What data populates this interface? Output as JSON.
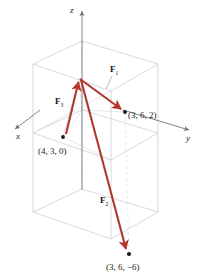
{
  "figure": {
    "background_color": "#ffffff",
    "vector_color": "#b4362b",
    "box_color": "#c9c9c9",
    "axis_color": "#6e6e6e",
    "point_color": "#1a1a1a"
  },
  "axes": [
    {
      "name": "x-axis",
      "label": "x",
      "label_x": 16,
      "label_y": 139,
      "arrow_from_x": 40,
      "arrow_from_y": 110,
      "arrow_to_x": 13,
      "arrow_to_y": 130
    },
    {
      "name": "y-axis",
      "label": "y",
      "label_x": 186,
      "label_y": 141,
      "arrow_from_x": 123,
      "arrow_from_y": 110,
      "arrow_to_x": 191,
      "arrow_to_y": 131
    },
    {
      "name": "z-axis",
      "label": "z",
      "label_x": 70,
      "label_y": 12,
      "arrow_from_x": 82,
      "arrow_from_y": 190,
      "arrow_to_x": 82,
      "arrow_to_y": 8
    }
  ],
  "origin": {
    "label": "origin",
    "x": 82,
    "y": 110
  },
  "apex": {
    "label": "common initial point",
    "x": 79,
    "y": 78
  },
  "vectors": [
    {
      "name": "F1",
      "label": "F",
      "subscript": "1",
      "label_x": 110,
      "label_y": 72,
      "tail_x": 80,
      "tail_y": 79,
      "head_x": 124,
      "head_y": 111,
      "leader_from_x": 112,
      "leader_from_y": 76,
      "leader_to_x": 107,
      "leader_to_y": 88
    },
    {
      "name": "F2",
      "label": "F",
      "subscript": "2",
      "label_x": 100,
      "label_y": 203,
      "tail_x": 81,
      "tail_y": 80,
      "head_x": 128,
      "head_y": 252,
      "leader_from_x": 0,
      "leader_from_y": 0,
      "leader_to_x": 0,
      "leader_to_y": 0
    },
    {
      "name": "F3",
      "label": "F",
      "subscript": "3",
      "label_x": 55,
      "label_y": 104,
      "tail_x": 66,
      "tail_y": 134,
      "head_x": 78,
      "head_y": 80,
      "leader_from_x": 0,
      "leader_from_y": 0,
      "leader_to_x": 0,
      "leader_to_y": 0
    }
  ],
  "points": [
    {
      "name": "point-3-6-2",
      "label": "(3, 6, 2)",
      "x": 125,
      "y": 112,
      "label_x": 128,
      "label_y": 118
    },
    {
      "name": "point-4-3-0",
      "label": "(4, 3, 0)",
      "x": 63,
      "y": 137,
      "label_x": 38,
      "label_y": 154
    },
    {
      "name": "point-3-6-neg6",
      "label": "(3, 6, −6)",
      "x": 129,
      "y": 254,
      "label_x": 106,
      "label_y": 270
    }
  ],
  "caption": {
    "text": ""
  }
}
